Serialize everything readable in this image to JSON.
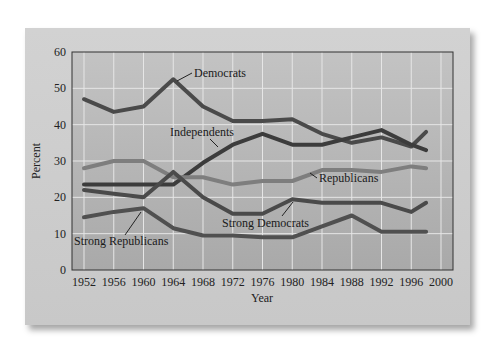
{
  "chart_data": {
    "type": "line",
    "title": "",
    "xlabel": "Year",
    "ylabel": "Percent",
    "xlim": [
      1952,
      2000
    ],
    "ylim": [
      0,
      60
    ],
    "grid": true,
    "x_ticks": [
      "1952",
      "1956",
      "1960",
      "1964",
      "1968",
      "1972",
      "1976",
      "1980",
      "1984",
      "1988",
      "1992",
      "1996",
      "2000"
    ],
    "y_ticks": [
      "0",
      "10",
      "20",
      "30",
      "40",
      "50",
      "60"
    ],
    "x": [
      1952,
      1956,
      1960,
      1964,
      1968,
      1972,
      1976,
      1980,
      1984,
      1988,
      1992,
      1996,
      1998
    ],
    "series": [
      {
        "name": "Democrats",
        "color": "#4a4a4a",
        "values": [
          47,
          43.5,
          45,
          52.5,
          45,
          41,
          41,
          41.5,
          37.5,
          35,
          36.5,
          34,
          38
        ]
      },
      {
        "name": "Independents",
        "color": "#3c3c3c",
        "values": [
          23.5,
          23.5,
          23.5,
          23.5,
          29.5,
          34.5,
          37.5,
          34.5,
          34.5,
          36.5,
          38.5,
          34.5,
          33
        ]
      },
      {
        "name": "Republicans",
        "color": "#7e7e7e",
        "values": [
          28,
          30,
          30,
          25.5,
          25.5,
          23.5,
          24.5,
          24.5,
          27.5,
          27.5,
          27,
          28.5,
          28
        ]
      },
      {
        "name": "Strong Democrats",
        "color": "#4a4a4a",
        "values": [
          22,
          21,
          20,
          27,
          20,
          15.5,
          15.5,
          19.5,
          18.5,
          18.5,
          18.5,
          16,
          18.5
        ]
      },
      {
        "name": "Strong Republicans",
        "color": "#505050",
        "values": [
          14.5,
          16,
          17,
          11.5,
          9.5,
          9.5,
          9,
          9,
          12,
          15,
          10.5,
          10.5,
          10.5
        ]
      }
    ],
    "annotations": [
      {
        "text": "Democrats",
        "series": "Democrats"
      },
      {
        "text": "Independents",
        "series": "Independents"
      },
      {
        "text": "Republicans",
        "series": "Republicans"
      },
      {
        "text": "Strong Democrats",
        "series": "Strong Democrats"
      },
      {
        "text": "Strong Republicans",
        "series": "Strong Republicans"
      }
    ],
    "legend": "none (inline labels)"
  }
}
